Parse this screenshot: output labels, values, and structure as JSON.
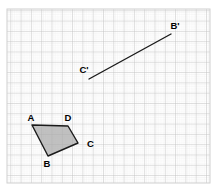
{
  "figure": {
    "background_color": "#ffffff",
    "grid": {
      "minor_spacing_px": 2.06,
      "major_spacing_px": 10.3,
      "minor_color": "#e8e8e8",
      "major_color": "#c2c2c2",
      "frame_color": "#cfcfcf",
      "frame": {
        "x": 7,
        "y": 9,
        "width": 203,
        "height": 174
      }
    },
    "stroke_color": "#1a1a1a",
    "label_color": "#000000",
    "polygon": {
      "name": "ABCD",
      "fill_color": "#a9a9a9",
      "fill_opacity": 0.72,
      "stroke_width": 1.4,
      "vertices": [
        {
          "label": "A",
          "x": 32,
          "y": 125,
          "label_x": 31,
          "label_y": 121
        },
        {
          "label": "B",
          "x": 48,
          "y": 156,
          "label_x": 47,
          "label_y": 167
        },
        {
          "label": "C",
          "x": 78,
          "y": 143,
          "label_x": 87,
          "label_y": 147
        },
        {
          "label": "D",
          "x": 68,
          "y": 126,
          "label_x": 68,
          "label_y": 121
        }
      ]
    },
    "segment": {
      "name": "C'B'",
      "stroke_width": 1.4,
      "start": {
        "label": "C'",
        "x": 89,
        "y": 79,
        "label_x": 84,
        "label_y": 73
      },
      "end": {
        "label": "B'",
        "x": 171,
        "y": 34,
        "label_x": 175,
        "label_y": 29
      }
    },
    "labels": {
      "A": "A",
      "B": "B",
      "C": "C",
      "D": "D",
      "C_prime": "C'",
      "B_prime": "B'"
    },
    "label_font_size": 9.5
  }
}
